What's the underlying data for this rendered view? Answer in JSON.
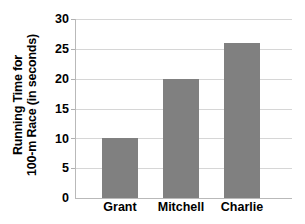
{
  "chart_data": {
    "type": "bar",
    "title": "",
    "xlabel": "",
    "ylabel": "Running Time for 100-m Race (in seconds)",
    "ylabel_lines": [
      "Running Time for",
      "100-m Race (in seconds)"
    ],
    "categories": [
      "Grant",
      "Mitchell",
      "Charlie"
    ],
    "values": [
      10,
      20,
      26
    ],
    "series": [
      {
        "name": "Running Time",
        "values": [
          10,
          20,
          26
        ]
      }
    ],
    "ylim": [
      0,
      30
    ],
    "ytick_labels": [
      "30",
      "25",
      "20",
      "15",
      "10",
      "5",
      "0"
    ],
    "ytick_values": [
      30,
      25,
      20,
      15,
      10,
      5,
      0
    ],
    "ytick_step": 5,
    "grid": true,
    "grid_axis": "y",
    "legend": false,
    "legend_position": "none",
    "bar_color": "#808080",
    "gridline_color": "#d6d6d6",
    "axis_color": "#b9b9b9",
    "text_color": "#000000",
    "background_color": "#ffffff"
  }
}
